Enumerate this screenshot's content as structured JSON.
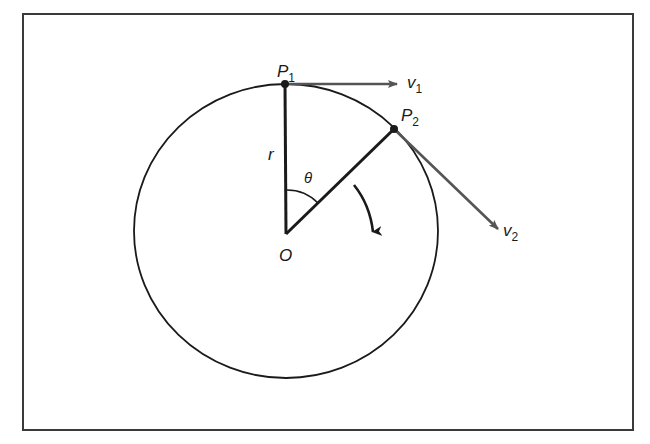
{
  "diagram": {
    "type": "circular-motion-velocity",
    "frame": {
      "x": 23,
      "y": 14,
      "width": 610,
      "height": 416,
      "stroke": "#3a3a3a"
    },
    "circle": {
      "cx": 286,
      "cy": 232,
      "r": 150,
      "stroke": "#1a1a1a"
    },
    "center": {
      "label": "O",
      "x": 286,
      "y": 234
    },
    "points": [
      {
        "id": "P1",
        "label": "P",
        "subscript": "1",
        "x": 285,
        "y": 84
      },
      {
        "id": "P2",
        "label": "P",
        "subscript": "2",
        "x": 394,
        "y": 129
      }
    ],
    "radius_label": "r",
    "angle_label": "θ",
    "vectors": [
      {
        "id": "v1",
        "label": "v",
        "subscript": "1",
        "from": [
          285,
          84
        ],
        "to": [
          397,
          84
        ],
        "color": "#555555"
      },
      {
        "id": "v2",
        "label": "v",
        "subscript": "2",
        "from": [
          394,
          129
        ],
        "to": [
          498,
          229
        ],
        "color": "#555555"
      }
    ],
    "rotation_arrow": {
      "direction": "clockwise",
      "color": "#1a1a1a"
    }
  }
}
